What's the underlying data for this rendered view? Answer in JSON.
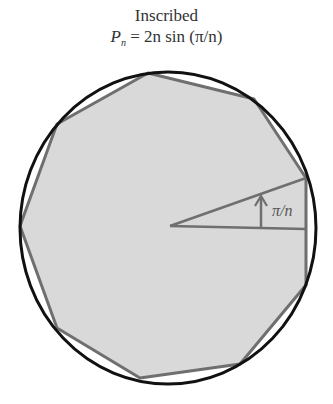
{
  "title": "Inscribed",
  "formula": {
    "lhs_symbol": "P",
    "lhs_subscript": "n",
    "equals": "=",
    "rhs": "2n sin (π/n)"
  },
  "diagram": {
    "angle_label": "π/n",
    "circle": {
      "cx": 168,
      "cy": 228,
      "rx": 148,
      "ry": 156,
      "stroke": "#111111"
    },
    "polygon": {
      "sides": 9,
      "fill": "#d9d9d9",
      "stroke": "#6f6f6f",
      "points": "148,73 254,99 306,178 306,285 240,364 140,378 57,328 20,226 57,124"
    },
    "angle_lines_color": "#6f6f6f"
  }
}
